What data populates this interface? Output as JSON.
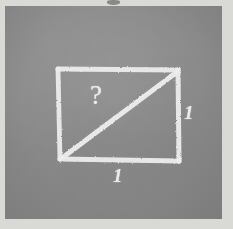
{
  "diagram": {
    "medium": "chalk-on-slate hand sketch",
    "background_color": "#8b8b8b",
    "chalk_color": "#ececec",
    "border_color": "#d9d9d6",
    "shape": {
      "type": "rectangle",
      "name": "square",
      "has_diagonal": true,
      "diagonal_from": "bottom-left",
      "diagonal_to": "top-right"
    },
    "labels": {
      "unknown": "?",
      "side_right": "1",
      "side_bottom": "1"
    },
    "marks": {
      "top_smudge": "smudge-mark"
    }
  }
}
